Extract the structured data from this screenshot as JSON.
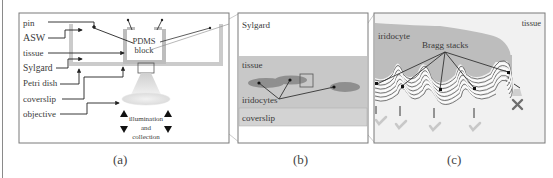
{
  "figure": {
    "panels": [
      {
        "id": "a",
        "caption": "(a)",
        "labels": {
          "pin": "pin",
          "asw": "ASW",
          "tissue": "tissue",
          "sylgard": "Sylgard",
          "petri_dish": "Petri dish",
          "coverslip": "coverslip",
          "objective": "objective",
          "pdms_line1": "PDMS",
          "pdms_line2": "block",
          "illum_line1": "illumination",
          "illum_line2": "and",
          "illum_line3": "collection"
        }
      },
      {
        "id": "b",
        "caption": "(b)",
        "labels": {
          "sylgard": "Sylgard",
          "tissue": "tissue",
          "iridocytes": "iridocytes",
          "coverslip": "coverslip"
        }
      },
      {
        "id": "c",
        "caption": "(c)",
        "labels": {
          "tissue": "tissue",
          "iridocyte": "iridocyte",
          "bragg_stacks": "Bragg stacks"
        }
      }
    ],
    "colors": {
      "panel_border": "#7a7a7a",
      "dish_gray": "#c9c9c9",
      "tissue_gray": "#c4c4c4",
      "coverslip_gray": "#d2d2d2",
      "iridocyte_ellipse": "#8f8f8f",
      "leader_line": "#333333",
      "cell_fill": "#bdbdbd",
      "check_mark": "#c8c8c8",
      "cross_mark": "#6e6e6e"
    }
  }
}
